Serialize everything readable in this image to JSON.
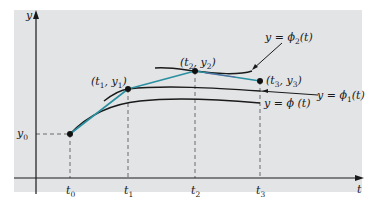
{
  "figure": {
    "background_color": "#ffffff",
    "panel_color": "#e3e4e6",
    "axis_color": "#1a1a1a",
    "curve_color": "#1a1a1a",
    "euler_segment_color": "#2a8fa0",
    "dashed_color": "#6b6b6b",
    "axes": {
      "x_label": "t",
      "y_label": "y"
    },
    "t_ticks": [
      {
        "base": "t",
        "sub": "0"
      },
      {
        "base": "t",
        "sub": "1"
      },
      {
        "base": "t",
        "sub": "2"
      },
      {
        "base": "t",
        "sub": "3"
      }
    ],
    "y_tick": {
      "base": "y",
      "sub": "0"
    },
    "points": [
      {
        "label_t": "t",
        "sub_t": "1",
        "label_y": "y",
        "sub_y": "1",
        "text": "(t1, y1)"
      },
      {
        "label_t": "t",
        "sub_t": "2",
        "label_y": "y",
        "sub_y": "2",
        "text": "(t2, y2)"
      },
      {
        "label_t": "t",
        "sub_t": "3",
        "label_y": "y",
        "sub_y": "3",
        "text": "(t3, y3)"
      }
    ],
    "curve_labels": {
      "phi": {
        "prefix": "y = ",
        "func": "ϕ",
        "sub": "",
        "arg": " (t)",
        "text": "y = ϕ(t)"
      },
      "phi1": {
        "prefix": "y = ",
        "func": "ϕ",
        "sub": "1",
        "arg": "(t)",
        "text": "y = ϕ1(t)"
      },
      "phi2": {
        "prefix": "y = ",
        "func": "ϕ",
        "sub": "2",
        "arg": "(t)",
        "text": "y = ϕ2(t)"
      }
    }
  }
}
